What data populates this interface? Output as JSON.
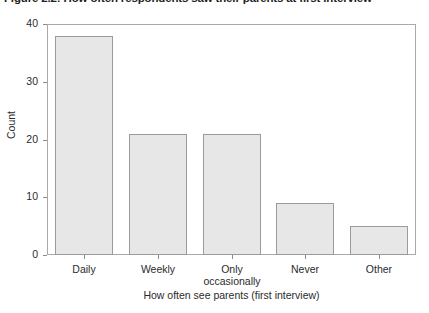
{
  "figure": {
    "title": "Figure 2.2: How often respondents saw their parents at first interview"
  },
  "chart_data": {
    "type": "bar",
    "title": "Figure 2.2: How often respondents saw their parents at first interview",
    "categories": [
      "Daily",
      "Weekly",
      "Only occasionally",
      "Never",
      "Other"
    ],
    "category_lines": [
      [
        "Daily"
      ],
      [
        "Weekly"
      ],
      [
        "Only",
        "occasionally"
      ],
      [
        "Never"
      ],
      [
        "Other"
      ]
    ],
    "values": [
      38,
      21,
      21,
      9,
      5
    ],
    "xlabel": "How often see parents (first interview)",
    "ylabel": "Count",
    "ylim": [
      0,
      40
    ],
    "yticks": [
      0,
      10,
      20,
      30,
      40
    ],
    "ytick_labels": [
      "0",
      "10",
      "20",
      "30",
      "40"
    ],
    "grid": false,
    "legend": null,
    "bar_fill_color": "#e7e7e7",
    "bar_border_color": "#9b9b9b",
    "axis_color": "#aaaaaa",
    "background_color": "#ffffff"
  }
}
